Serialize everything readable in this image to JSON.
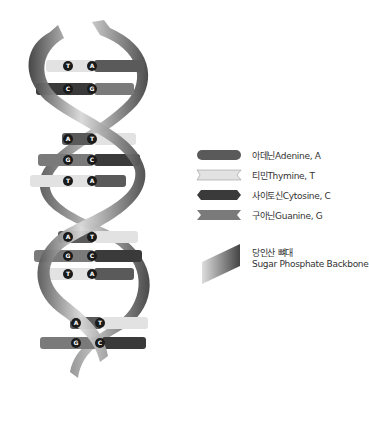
{
  "diagram": {
    "base_pairs": [
      {
        "left": "T",
        "right": "A"
      },
      {
        "left": "C",
        "right": "G"
      },
      {
        "left": "A",
        "right": "T"
      },
      {
        "left": "G",
        "right": "C"
      },
      {
        "left": "T",
        "right": "A"
      },
      {
        "left": "A",
        "right": "T"
      },
      {
        "left": "G",
        "right": "C"
      },
      {
        "left": "T",
        "right": "A"
      },
      {
        "left": "A",
        "right": "T"
      },
      {
        "left": "G",
        "right": "C"
      }
    ],
    "colors": {
      "adenine": "#5a5a5a",
      "thymine": "#e2e2e2",
      "cytosine": "#3a3a3a",
      "guanine": "#7a7a7a",
      "backbone_light": "#d8d8d8",
      "backbone_dark": "#4a4a4a"
    }
  },
  "legend": {
    "items": [
      {
        "label": "아데닌Adenine, A"
      },
      {
        "label": "티민Thymine, T"
      },
      {
        "label": "사이토신Cytosine, C"
      },
      {
        "label": "구아닌Guanine, G"
      }
    ],
    "backbone": {
      "label_ko": "당인산 뼈대",
      "label_en": "Sugar Phosphate Backbone"
    }
  }
}
